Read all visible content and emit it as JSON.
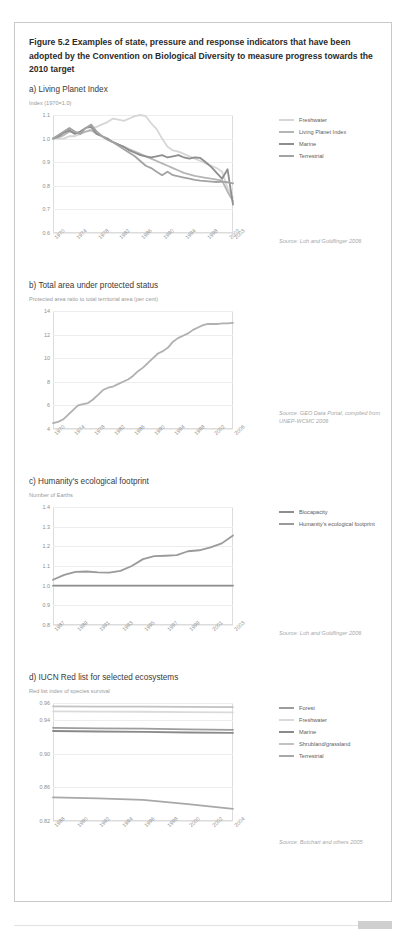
{
  "figure": {
    "title": "Figure 5.2 Examples of state, pressure and response indicators that have been adopted by the Convention on Biological Diversity to measure progress towards the 2010 target"
  },
  "panels": [
    {
      "key": "a",
      "title": "a) Living Planet Index",
      "subtitle": "Index (1970=1.0)",
      "source": "Source: Loh and Goldfinger 2006"
    },
    {
      "key": "b",
      "title": "b) Total area under protected status",
      "subtitle": "Protected area ratio to total territorial area (per cent)",
      "source": "Source: GEO Data Portal, compiled from UNEP-WCMC 2006"
    },
    {
      "key": "c",
      "title": "c) Humanity's ecological footprint",
      "subtitle": "Number of Earths",
      "source": "Source: Loh and Goldfinger 2006"
    },
    {
      "key": "d",
      "title": "d) IUCN Red list for selected ecosystems",
      "subtitle": "Red list index of species survival",
      "source": "Source: Butchart and others 2005"
    }
  ],
  "chart_data": [
    {
      "type": "line",
      "title": "a) Living Planet Index",
      "ylabel": "Index (1970=1.0)",
      "xlabel": "",
      "ylim": [
        0.6,
        1.1
      ],
      "yticks": [
        0.6,
        0.7,
        0.8,
        0.9,
        1.0,
        1.1
      ],
      "ytick_labels": [
        "0.6",
        "0.7",
        "0.8",
        "0.9",
        "1.0",
        "1.1"
      ],
      "xlim": [
        1970,
        2003
      ],
      "xticks": [
        1970,
        1974,
        1978,
        1982,
        1986,
        1990,
        1994,
        1998,
        2002,
        2003
      ],
      "xtick_labels": [
        "1970",
        "1974",
        "1978",
        "1982",
        "1986",
        "1990",
        "1994",
        "1998",
        "2002",
        "2003"
      ],
      "grid": true,
      "legend_position": "right",
      "series": [
        {
          "name": "Freshwater",
          "color": "#d6d6d6",
          "x": [
            1970,
            1971,
            1972,
            1973,
            1974,
            1975,
            1976,
            1977,
            1978,
            1979,
            1980,
            1981,
            1982,
            1983,
            1984,
            1985,
            1986,
            1987,
            1988,
            1989,
            1990,
            1991,
            1992,
            1993,
            1994,
            1995,
            1996,
            1997,
            1998,
            1999,
            2000,
            2001,
            2002,
            2003
          ],
          "values": [
            1.0,
            1.0,
            1.0,
            1.01,
            1.01,
            1.02,
            1.03,
            1.04,
            1.05,
            1.06,
            1.07,
            1.085,
            1.08,
            1.075,
            1.085,
            1.095,
            1.1,
            1.095,
            1.065,
            1.04,
            1.0,
            0.965,
            0.95,
            0.945,
            0.935,
            0.925,
            0.915,
            0.905,
            0.895,
            0.885,
            0.875,
            0.86,
            0.79,
            0.75
          ]
        },
        {
          "name": "Living Planet Index",
          "color": "#b5b5b5",
          "x": [
            1970,
            1971,
            1972,
            1973,
            1974,
            1975,
            1976,
            1977,
            1978,
            1979,
            1980,
            1981,
            1982,
            1983,
            1984,
            1985,
            1986,
            1987,
            1988,
            1989,
            1990,
            1991,
            1992,
            1993,
            1994,
            1995,
            1996,
            1997,
            1998,
            1999,
            2000,
            2001,
            2002,
            2003
          ],
          "values": [
            1.0,
            1.005,
            1.015,
            1.03,
            1.025,
            1.02,
            1.03,
            1.035,
            1.02,
            1.01,
            0.995,
            0.985,
            0.975,
            0.965,
            0.955,
            0.945,
            0.935,
            0.925,
            0.915,
            0.905,
            0.895,
            0.885,
            0.875,
            0.865,
            0.855,
            0.848,
            0.842,
            0.838,
            0.834,
            0.83,
            0.826,
            0.822,
            0.775,
            0.735
          ]
        },
        {
          "name": "Marine",
          "color": "#8e8e8e",
          "x": [
            1970,
            1971,
            1972,
            1973,
            1974,
            1975,
            1976,
            1977,
            1978,
            1979,
            1980,
            1981,
            1982,
            1983,
            1984,
            1985,
            1986,
            1987,
            1988,
            1989,
            1990,
            1991,
            1992,
            1993,
            1994,
            1995,
            1996,
            1997,
            1998,
            1999,
            2000,
            2001,
            2002,
            2003
          ],
          "values": [
            1.0,
            1.01,
            1.025,
            1.035,
            1.02,
            1.03,
            1.045,
            1.05,
            1.02,
            1.01,
            1.0,
            0.985,
            0.975,
            0.965,
            0.95,
            0.94,
            0.93,
            0.925,
            0.92,
            0.925,
            0.93,
            0.92,
            0.925,
            0.93,
            0.92,
            0.915,
            0.92,
            0.918,
            0.9,
            0.88,
            0.855,
            0.83,
            0.87,
            0.72
          ]
        },
        {
          "name": "Terrestrial",
          "color": "#a3a3a3",
          "x": [
            1970,
            1971,
            1972,
            1973,
            1974,
            1975,
            1976,
            1977,
            1978,
            1979,
            1980,
            1981,
            1982,
            1983,
            1984,
            1985,
            1986,
            1987,
            1988,
            1989,
            1990,
            1991,
            1992,
            1993,
            1994,
            1995,
            1996,
            1997,
            1998,
            1999,
            2000,
            2001,
            2002,
            2003
          ],
          "values": [
            1.0,
            1.015,
            1.03,
            1.045,
            1.03,
            1.02,
            1.045,
            1.06,
            1.03,
            1.01,
            0.995,
            0.985,
            0.97,
            0.955,
            0.94,
            0.925,
            0.905,
            0.885,
            0.875,
            0.86,
            0.845,
            0.86,
            0.845,
            0.84,
            0.835,
            0.83,
            0.825,
            0.822,
            0.82,
            0.818,
            0.816,
            0.818,
            0.815,
            0.81
          ]
        }
      ]
    },
    {
      "type": "line",
      "title": "b) Total area under protected status",
      "ylabel": "Protected area ratio to total territorial area (per cent)",
      "xlabel": "",
      "ylim": [
        4,
        14
      ],
      "yticks": [
        4,
        6,
        8,
        10,
        12,
        14
      ],
      "ytick_labels": [
        "4",
        "6",
        "8",
        "10",
        "12",
        "14"
      ],
      "xlim": [
        1970,
        2006
      ],
      "xticks": [
        1970,
        1974,
        1978,
        1982,
        1986,
        1990,
        1994,
        1998,
        2002,
        2006
      ],
      "xtick_labels": [
        "1970",
        "1974",
        "1978",
        "1982",
        "1986",
        "1990",
        "1994",
        "1998",
        "2002",
        "2006"
      ],
      "grid": true,
      "legend_position": "none",
      "series": [
        {
          "name": "Protected area ratio",
          "color": "#b0b0b0",
          "x": [
            1970,
            1971,
            1972,
            1973,
            1974,
            1975,
            1976,
            1977,
            1978,
            1979,
            1980,
            1981,
            1982,
            1983,
            1984,
            1985,
            1986,
            1987,
            1988,
            1989,
            1990,
            1991,
            1992,
            1993,
            1994,
            1995,
            1996,
            1997,
            1998,
            1999,
            2000,
            2001,
            2002,
            2003,
            2004,
            2005,
            2006
          ],
          "values": [
            4.5,
            4.6,
            4.8,
            5.2,
            5.6,
            6.0,
            6.1,
            6.2,
            6.5,
            6.9,
            7.3,
            7.5,
            7.6,
            7.8,
            8.0,
            8.2,
            8.5,
            8.9,
            9.2,
            9.6,
            10.0,
            10.4,
            10.6,
            10.9,
            11.4,
            11.7,
            11.9,
            12.1,
            12.4,
            12.6,
            12.8,
            12.9,
            12.9,
            12.9,
            12.95,
            12.95,
            13.0
          ]
        }
      ]
    },
    {
      "type": "line",
      "title": "c) Humanity's ecological footprint",
      "ylabel": "Number of Earths",
      "xlabel": "",
      "ylim": [
        0.8,
        1.4
      ],
      "yticks": [
        0.8,
        0.9,
        1.0,
        1.1,
        1.2,
        1.3,
        1.4
      ],
      "ytick_labels": [
        "0.8",
        "0.9",
        "1.0",
        "1.1",
        "1.2",
        "1.3",
        "1.4"
      ],
      "xlim": [
        1987,
        2003
      ],
      "xticks": [
        1987,
        1989,
        1991,
        1993,
        1995,
        1997,
        1999,
        2001,
        2003
      ],
      "xtick_labels": [
        "1987",
        "1989",
        "1991",
        "1993",
        "1995",
        "1997",
        "1999",
        "2001",
        "2003"
      ],
      "grid": true,
      "legend_position": "right",
      "series": [
        {
          "name": "Biocapacity",
          "color": "#8e8e8e",
          "x": [
            1987,
            2003
          ],
          "values": [
            1.0,
            1.0
          ]
        },
        {
          "name": "Humanity's ecological footprint",
          "color": "#9a9a9a",
          "x": [
            1987,
            1988,
            1989,
            1990,
            1991,
            1992,
            1993,
            1994,
            1995,
            1996,
            1997,
            1998,
            1999,
            2000,
            2001,
            2002,
            2003
          ],
          "values": [
            1.03,
            1.055,
            1.07,
            1.072,
            1.068,
            1.066,
            1.075,
            1.1,
            1.135,
            1.15,
            1.152,
            1.155,
            1.175,
            1.18,
            1.195,
            1.215,
            1.255
          ]
        }
      ]
    },
    {
      "type": "line",
      "title": "d) IUCN Red list for selected ecosystems",
      "ylabel": "Red list index of species survival",
      "xlabel": "",
      "ylim": [
        0.82,
        0.96
      ],
      "yticks": [
        0.82,
        0.86,
        0.9,
        0.94,
        0.96
      ],
      "ytick_labels": [
        "0.82",
        "0.86",
        "0.90",
        "0.94",
        "0.96"
      ],
      "xlim": [
        1988,
        2004
      ],
      "xticks": [
        1988,
        1990,
        1992,
        1994,
        1996,
        1998,
        2000,
        2002,
        2004
      ],
      "xtick_labels": [
        "1988",
        "1990",
        "1992",
        "1994",
        "1996",
        "1998",
        "2000",
        "2002",
        "2004"
      ],
      "grid": true,
      "legend_position": "right",
      "series": [
        {
          "name": "Forest",
          "color": "#9d9d9d",
          "x": [
            1988,
            1992,
            1996,
            2000,
            2004
          ],
          "values": [
            0.9305,
            0.93,
            0.9295,
            0.9288,
            0.9282
          ]
        },
        {
          "name": "Freshwater",
          "color": "#dadada",
          "x": [
            1988,
            1992,
            1996,
            2000,
            2004
          ],
          "values": [
            0.95,
            0.9498,
            0.9496,
            0.9492,
            0.9488
          ]
        },
        {
          "name": "Marine",
          "color": "#8a8a8a",
          "x": [
            1988,
            1992,
            1996,
            2000,
            2004
          ],
          "values": [
            0.9268,
            0.9262,
            0.9258,
            0.925,
            0.9245
          ]
        },
        {
          "name": "Shrubland/grassland",
          "color": "#c2c2c2",
          "x": [
            1988,
            1992,
            1996,
            2000,
            2004
          ],
          "values": [
            0.956,
            0.9558,
            0.9556,
            0.9554,
            0.9552
          ]
        },
        {
          "name": "Terrestrial",
          "color": "#a8a8a8",
          "x": [
            1988,
            1992,
            1996,
            2000,
            2004
          ],
          "values": [
            0.848,
            0.8468,
            0.845,
            0.84,
            0.8345
          ]
        }
      ]
    }
  ]
}
